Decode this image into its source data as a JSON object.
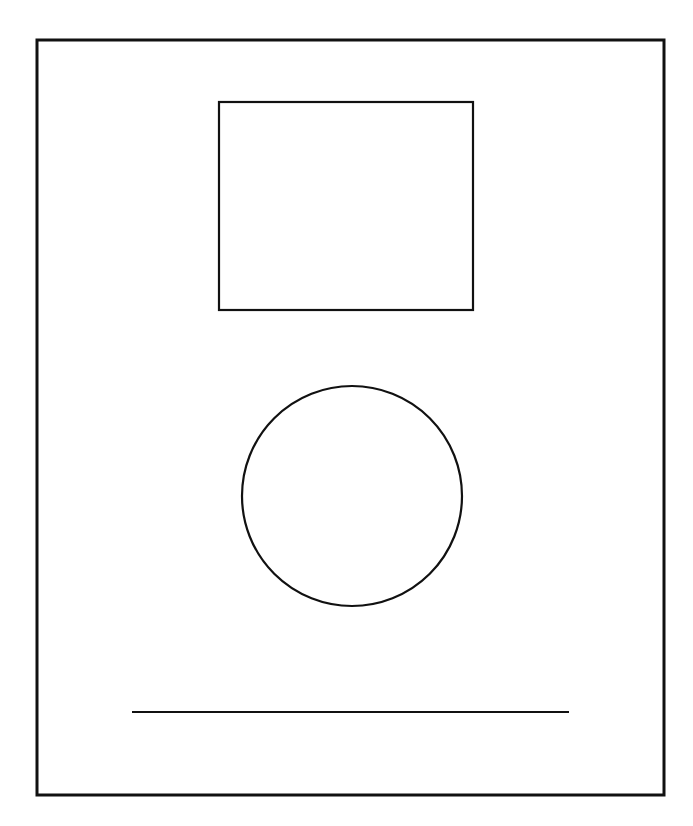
{
  "canvas": {
    "width": 693,
    "height": 826,
    "background": "#ffffff"
  },
  "colors": {
    "stroke": "#111111"
  },
  "shapes": {
    "frame": {
      "x": 37,
      "y": 40,
      "width": 627,
      "height": 755,
      "stroke_width": 3
    },
    "rectangle": {
      "x": 219,
      "y": 102,
      "width": 254,
      "height": 208,
      "stroke_width": 2.2
    },
    "circle": {
      "cx": 352,
      "cy": 496,
      "r": 110,
      "stroke_width": 2.2
    },
    "line": {
      "x1": 132,
      "y1": 712,
      "x2": 569,
      "y2": 712,
      "stroke_width": 2
    }
  }
}
